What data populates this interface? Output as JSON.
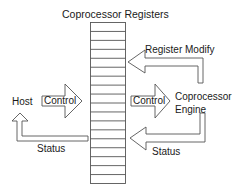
{
  "diagram": {
    "title": "Coprocessor Registers",
    "register_count": 18,
    "nodes": {
      "host": "Host",
      "engine_line1": "Coprocessor",
      "engine_line2": "Engine"
    },
    "arrows": {
      "host_control": "Control",
      "engine_control": "Control",
      "register_modify": "Register Modify",
      "engine_status": "Status",
      "host_status": "Status"
    },
    "colors": {
      "stroke": "#555555",
      "fill": "#ffffff",
      "text": "#1a1a1a"
    }
  }
}
